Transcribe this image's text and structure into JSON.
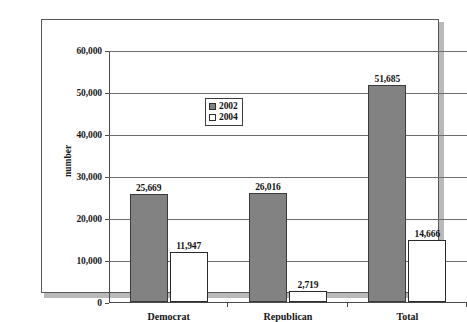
{
  "chart_data": {
    "type": "bar",
    "title": "",
    "xlabel": "",
    "ylabel": "number",
    "categories": [
      "Democrat",
      "Republican",
      "Total"
    ],
    "series": [
      {
        "name": "2002",
        "values": [
          25669,
          26016,
          51685
        ],
        "labels": [
          "25,669",
          "26,016",
          "51,685"
        ],
        "color": "#828282"
      },
      {
        "name": "2004",
        "values": [
          11947,
          2719,
          14666
        ],
        "labels": [
          "11,947",
          "2,719",
          "14,666"
        ],
        "color": "#ffffff"
      }
    ],
    "ylim": [
      0,
      60000
    ],
    "ytick_values": [
      0,
      10000,
      20000,
      30000,
      40000,
      50000,
      60000
    ],
    "ytick_labels": [
      "0",
      "10,000",
      "20,000",
      "30,000",
      "40,000",
      "50,000",
      "60,000"
    ],
    "grid": "horizontal",
    "legend_position": "upper-center-left"
  },
  "axis": {
    "y_title": "number"
  },
  "legend": {
    "entries": [
      {
        "label": "2002",
        "swatch": "filled-gray-square"
      },
      {
        "label": "2004",
        "swatch": "empty-white-square"
      }
    ]
  }
}
